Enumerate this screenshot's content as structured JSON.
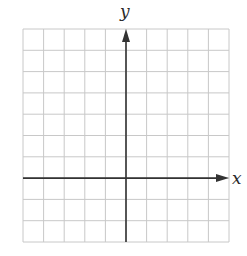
{
  "diagram": {
    "type": "coordinate-plane",
    "x_axis_label": "x",
    "y_axis_label": "y",
    "grid": {
      "columns": 10,
      "rows": 10,
      "left": 23,
      "top": 29,
      "right": 229,
      "bottom": 242,
      "line_color": "#c8c8c8",
      "axis_color": "#333333"
    },
    "origin_column": 5,
    "origin_row": 7,
    "x_range_units": [
      -5,
      5
    ],
    "y_range_units": [
      -3,
      7
    ]
  }
}
